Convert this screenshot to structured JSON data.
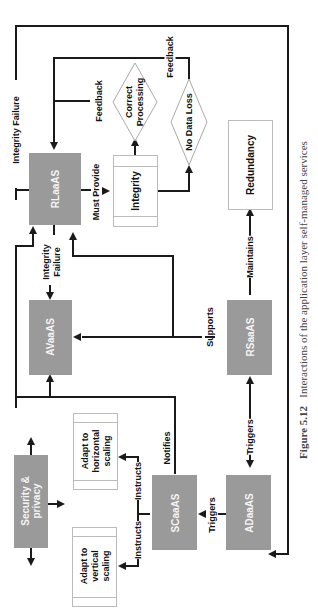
{
  "nodes": {
    "rlaaas": "RLaaAS",
    "avaaas": "AVaaAS",
    "rsaaas": "RSaaAS",
    "scaaas": "SCaaAS",
    "adaaas": "ADaaAS",
    "security": "Security &\nprivacy",
    "integrity": "Integrity",
    "redundancy": "Redundancy",
    "horizontal": "Adapt to\nhorizontal\nscaling",
    "vertical": "Adapt to\nvertical\nscaling",
    "correct_processing": "Correct\nProcessing",
    "no_data_loss": "No Data Loss"
  },
  "edges": {
    "integrity_failure_top": "Integrity Failure",
    "feedback_1": "Feedback",
    "feedback_2": "Feedback",
    "must_provide": "Must Provide",
    "integrity_failure_mid": "Integrity\nFailure",
    "maintains": "Maintains",
    "supports": "Supports",
    "triggers_1": "Triggers",
    "triggers_2": "Triggers",
    "notifies": "Notifies",
    "instructs_1": "Instructs",
    "instructs_2": "Instructs"
  },
  "caption": {
    "label": "Figure 5.12",
    "text": "Interactions of the application layer self-managed services"
  }
}
